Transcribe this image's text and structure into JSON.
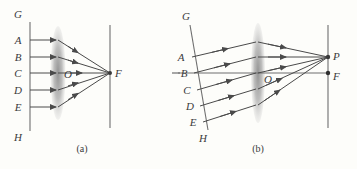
{
  "figure": {
    "background_color": "#fdfdfa",
    "ink_color": "#4a4a4a",
    "lens_color": "#9b9b9b",
    "panels": [
      {
        "id": "a",
        "caption": "(a)",
        "object_line": {
          "top_label": "G",
          "bottom_label": "H",
          "orientation": "vertical"
        },
        "ray_labels": [
          "A",
          "B",
          "C",
          "D",
          "E"
        ],
        "lens_center_label": "O",
        "focus_label": "F",
        "image_point_label": "F",
        "description": "Parallel rays from a vertical source line GH converge through the lens to the focal point F on the screen."
      },
      {
        "id": "b",
        "caption": "(b)",
        "object_line": {
          "top_label": "G",
          "bottom_label": "H",
          "orientation": "tilted"
        },
        "ray_labels": [
          "A",
          "B",
          "C",
          "D",
          "E"
        ],
        "lens_center_label": "O",
        "focus_label": "F",
        "image_point_label": "P",
        "description": "Rays from a tilted source line GH converge through the lens to point P above the focal point F."
      }
    ]
  }
}
